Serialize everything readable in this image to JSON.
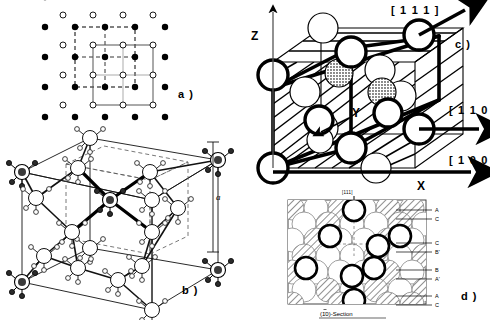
{
  "figure": {
    "panels": [
      {
        "id": "a",
        "tag": "a )",
        "caption": ""
      },
      {
        "id": "b",
        "tag": "b )",
        "caption": ""
      },
      {
        "id": "c",
        "tag": "c )",
        "caption": ""
      },
      {
        "id": "d",
        "tag": "d )",
        "caption": ""
      }
    ]
  },
  "panel_a": {
    "tag": "a )",
    "description": "Plan view of two interpenetrating square sublattices",
    "filled_cell_style": "dashed",
    "open_cell_style": "solid",
    "grid_columns": 5,
    "grid_rows": 5
  },
  "panel_b": {
    "tag": "b )",
    "description": "Tetrahedral bonded unit cell",
    "lattice_parameter_label": "a"
  },
  "panel_c": {
    "tag": "c )",
    "axes": {
      "z": "Z",
      "x": "X",
      "y": "Y"
    },
    "directions": [
      {
        "name": "dir-111",
        "label": "[ 1 1 1 ]"
      },
      {
        "name": "dir-110",
        "label": "[ 1 1 0 ]"
      },
      {
        "name": "dir-100",
        "label": "[ 1 0 0 ]"
      }
    ],
    "below_marker": "[111]"
  },
  "panel_d": {
    "tag": "d )",
    "section_label": "(1̈0)-Section",
    "section_label_plain": "(110)-Section",
    "top_marker": "[111]",
    "layer_labels": [
      "A",
      "C",
      "C",
      "B'",
      "B",
      "A'",
      "A",
      "C"
    ],
    "layer_groups": [
      {
        "name": "group-1",
        "top": "A",
        "bottom": "C"
      },
      {
        "name": "group-2",
        "top": "C",
        "bottom": "B'"
      },
      {
        "name": "group-3",
        "top": "B",
        "bottom": "A'"
      },
      {
        "name": "group-4",
        "top": "A",
        "bottom": "C"
      }
    ]
  },
  "colors": {
    "ink": "#000000",
    "paper": "#ffffff",
    "hatch": "#7a7a7a",
    "shade": "#9a9a9a",
    "light_line": "#333333"
  }
}
